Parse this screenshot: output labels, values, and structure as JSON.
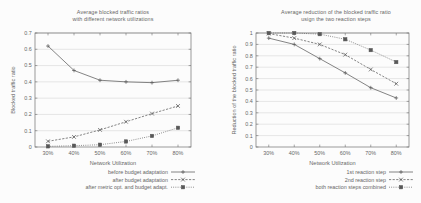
{
  "figure": {
    "background_color": "#ffffff",
    "ink_color": "#222222",
    "grid_color": "#b9b9b9"
  },
  "chart_data": [
    {
      "id": "left",
      "type": "line",
      "title": "Average blocked traffic ratios\nwith different network utilizations",
      "title_lines": [
        "Average blocked traffic ratios",
        "with different network utilizations"
      ],
      "xlabel": "Network Utilization",
      "ylabel": "Blocked traffic ratio",
      "categories": [
        "30%",
        "40%",
        "50%",
        "60%",
        "70%",
        "80%"
      ],
      "x": [
        30,
        40,
        50,
        60,
        70,
        80
      ],
      "xlim": [
        25,
        85
      ],
      "ylim": [
        0,
        0.7
      ],
      "yticks": [
        0,
        0.1,
        0.2,
        0.3,
        0.4,
        0.5,
        0.6,
        0.7
      ],
      "ytick_labels": [
        "0",
        "0.1",
        "0.2",
        "0.3",
        "0.4",
        "0.5",
        "0.6",
        "0.7"
      ],
      "grid": true,
      "legend_position": "below-right",
      "series": [
        {
          "name": "before budget adaptation",
          "values": [
            0.62,
            0.47,
            0.41,
            0.4,
            0.395,
            0.41
          ],
          "line_style": "solid",
          "marker": "plus"
        },
        {
          "name": "after budget adaptation",
          "values": [
            0.035,
            0.062,
            0.105,
            0.155,
            0.205,
            0.252
          ],
          "line_style": "dashed",
          "marker": "cross"
        },
        {
          "name": "after metric opt. and budget adapt.",
          "values": [
            0.004,
            0.008,
            0.014,
            0.034,
            0.068,
            0.118
          ],
          "line_style": "dotted",
          "marker": "square"
        }
      ]
    },
    {
      "id": "right",
      "type": "line",
      "title": "Average reduction of the blocked traffic ratio\nusign the two reaction steps",
      "title_lines": [
        "Average reduction of the blocked traffic ratio",
        "usign the two reaction steps"
      ],
      "xlabel": "Network Utilization",
      "ylabel": "Reduction of the blocked traffic ratio",
      "categories": [
        "30%",
        "40%",
        "50%",
        "60%",
        "70%",
        "80%"
      ],
      "x": [
        30,
        40,
        50,
        60,
        70,
        80
      ],
      "xlim": [
        25,
        85
      ],
      "ylim": [
        0,
        1
      ],
      "yticks": [
        0,
        0.1,
        0.2,
        0.3,
        0.4,
        0.5,
        0.6,
        0.7,
        0.8,
        0.9,
        1
      ],
      "ytick_labels": [
        "0",
        "0.1",
        "0.2",
        "0.3",
        "0.4",
        "0.5",
        "0.6",
        "0.7",
        "0.8",
        "0.9",
        "1"
      ],
      "grid": true,
      "legend_position": "below-right",
      "series": [
        {
          "name": "1st reaction step",
          "values": [
            0.955,
            0.9,
            0.775,
            0.65,
            0.52,
            0.43
          ],
          "line_style": "solid",
          "marker": "plus"
        },
        {
          "name": "2nd reaction step",
          "values": [
            0.995,
            0.955,
            0.9,
            0.81,
            0.68,
            0.555
          ],
          "line_style": "dashed",
          "marker": "cross"
        },
        {
          "name": "both reaction steps combined",
          "values": [
            1.0,
            1.0,
            0.99,
            0.945,
            0.85,
            0.745
          ],
          "line_style": "dotted",
          "marker": "square"
        }
      ]
    }
  ]
}
